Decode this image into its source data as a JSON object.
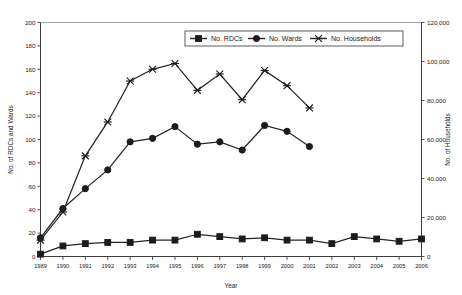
{
  "chart_data": {
    "type": "line",
    "title": "",
    "subtitle": "",
    "xlabel": "Year",
    "ylabel": "No. of RDCs and Wards",
    "y2label": "No. of Households",
    "grid": false,
    "legend_position": "top-center",
    "x": [
      1989,
      1990,
      1991,
      1992,
      1993,
      1994,
      1995,
      1996,
      1997,
      1998,
      1999,
      2000,
      2001,
      2002,
      2003,
      2004,
      2005,
      2006
    ],
    "categories": [
      "1989",
      "1990",
      "1991",
      "1992",
      "1993",
      "1994",
      "1995",
      "1996",
      "1997",
      "1998",
      "1999",
      "2000",
      "2001",
      "2002",
      "2003",
      "2004",
      "2005",
      "2006"
    ],
    "xlim": [
      1989,
      2006
    ],
    "ylim": [
      0,
      200
    ],
    "yticks": [
      0,
      20,
      40,
      60,
      80,
      100,
      120,
      140,
      160,
      180,
      200
    ],
    "ytick_labels": [
      "0",
      "20",
      "40",
      "60",
      "80",
      "100",
      "120",
      "140",
      "160",
      "180",
      "200"
    ],
    "y2lim": [
      0,
      120000
    ],
    "y2ticks": [
      0,
      20000,
      40000,
      60000,
      80000,
      100000,
      120000
    ],
    "y2tick_labels": [
      "0",
      "20,000",
      "40,000",
      "60,000",
      "80,000",
      "100,000",
      "120,000"
    ],
    "series": [
      {
        "name": "No. RDCs",
        "axis": "left",
        "marker": "square",
        "color": "#1c1c1c",
        "values": [
          2,
          9,
          11,
          12,
          12,
          14,
          14,
          19,
          17,
          15,
          16,
          14,
          14,
          11,
          17,
          15,
          13,
          15
        ]
      },
      {
        "name": "No. Wards",
        "axis": "left",
        "marker": "circle",
        "color": "#1c1c1c",
        "values": [
          16,
          41,
          58,
          74,
          98,
          101,
          111,
          96,
          98,
          91,
          112,
          107,
          94,
          null,
          null,
          null,
          null,
          null
        ]
      },
      {
        "name": "No. Households",
        "axis": "right",
        "marker": "cross",
        "color": "#1c1c1c",
        "values_left_scale": [
          14,
          38,
          86,
          115,
          150,
          160,
          165,
          142,
          156,
          134,
          159,
          146,
          127,
          null,
          null,
          null,
          null,
          null
        ],
        "values": [
          8400,
          22800,
          51600,
          69000,
          90000,
          96000,
          99000,
          85200,
          93600,
          80400,
          95400,
          87600,
          76200,
          null,
          null,
          null,
          null,
          null
        ]
      }
    ]
  },
  "legend": {
    "items": [
      {
        "label": "No. RDCs",
        "marker": "square"
      },
      {
        "label": "No. Wards",
        "marker": "circle"
      },
      {
        "label": "No. Households",
        "marker": "cross"
      }
    ]
  },
  "axes": {
    "left_title": "No. of RDCs and Wards",
    "right_title": "No. of Households",
    "x_title": "Year"
  }
}
